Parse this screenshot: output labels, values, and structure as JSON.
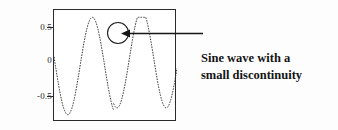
{
  "figure": {
    "annotation_lines": [
      "Sine wave with a",
      "small discontinuity"
    ],
    "line1": "Sine wave with a",
    "line2": "small discontinuity",
    "curve_color": "#333333",
    "frame_color": "#2a2a2a",
    "annotation_color": "#141414",
    "background_color": "#ffffff"
  },
  "chart_data": {
    "type": "line",
    "title": "",
    "xlabel": "",
    "ylabel": "",
    "xlim": [
      0,
      2.5
    ],
    "ylim": [
      -1.15,
      1.15
    ],
    "grid": false,
    "legend": null,
    "y_ticks": [
      0.5,
      0,
      -0.5
    ],
    "y_tick_labels": [
      "0.5",
      "0",
      "-0.5"
    ],
    "x_ticks": [],
    "x_tick_labels": [],
    "series": [
      {
        "name": "sine wave with small discontinuity",
        "description": "sin(2*pi*x) over roughly 2.5 periods, drawn as a fine dotted curve, with a small step discontinuity near the crest of the second positive peak",
        "period": 1.0,
        "amplitude": 1.0,
        "n_periods": 2.5,
        "discontinuity": {
          "x": 1.21,
          "y_before": 0.78,
          "y_after": 0.92,
          "jump": 0.14
        },
        "x": [
          0.0,
          0.05,
          0.1,
          0.15,
          0.2,
          0.25,
          0.3,
          0.35,
          0.4,
          0.45,
          0.5,
          0.55,
          0.6,
          0.65,
          0.7,
          0.75,
          0.8,
          0.85,
          0.9,
          0.95,
          1.0,
          1.05,
          1.1,
          1.15,
          1.2,
          1.25,
          1.3,
          1.35,
          1.4,
          1.45,
          1.5,
          1.55,
          1.6,
          1.65,
          1.7,
          1.75,
          1.8,
          1.85,
          1.9,
          1.95,
          2.0,
          2.05,
          2.1,
          2.15,
          2.2,
          2.25,
          2.3,
          2.35,
          2.4,
          2.45,
          2.5
        ],
        "y": [
          -0.19,
          0.12,
          0.43,
          0.68,
          0.87,
          0.98,
          1.0,
          0.93,
          0.78,
          0.56,
          0.29,
          0.0,
          -0.29,
          -0.56,
          -0.78,
          -0.93,
          -1.0,
          -0.98,
          -0.87,
          -0.68,
          -0.43,
          -0.12,
          0.19,
          0.48,
          0.73,
          0.92,
          1.0,
          0.98,
          0.87,
          0.68,
          0.43,
          0.12,
          -0.19,
          -0.48,
          -0.73,
          -0.9,
          -1.0,
          -0.98,
          -0.87,
          -0.68,
          -0.43,
          -0.12,
          0.19,
          0.48,
          0.73,
          0.9,
          1.0,
          0.98,
          0.87,
          0.68,
          0.43
        ]
      }
    ],
    "annotations": [
      {
        "type": "circle-highlight",
        "target": "discontinuity",
        "center_x": 1.21,
        "center_y": 0.62,
        "radius_px": 10
      },
      {
        "type": "arrow",
        "text": "Sine wave with a small discontinuity",
        "points_to": "discontinuity",
        "direction": "left"
      }
    ]
  }
}
